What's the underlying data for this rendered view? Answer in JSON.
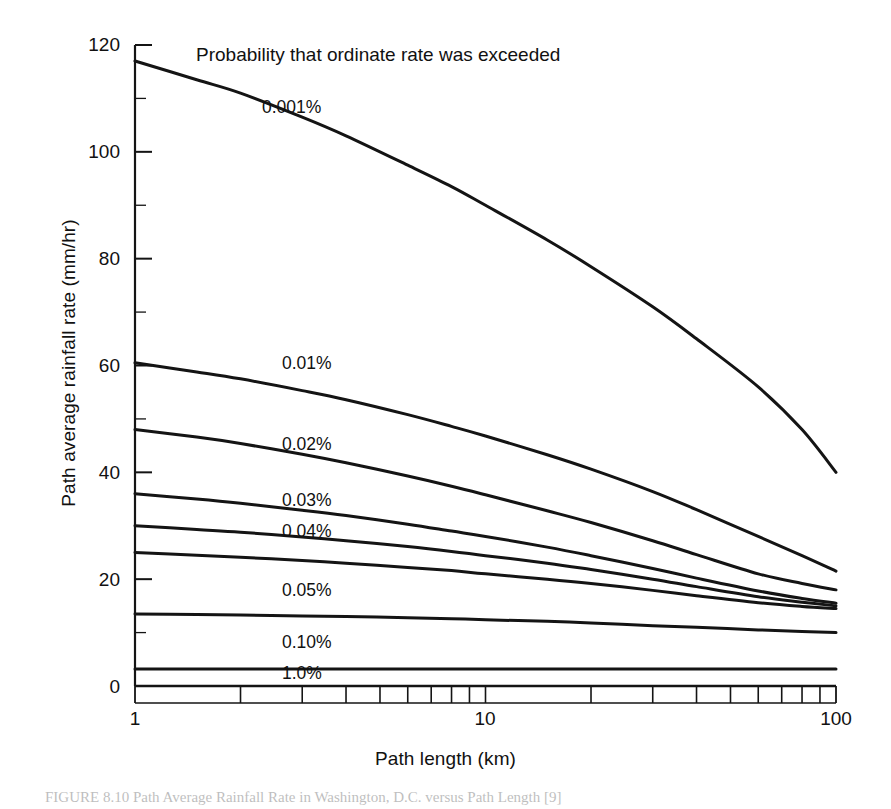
{
  "chart_data": {
    "type": "line",
    "title": "",
    "xlabel": "Path length (km)",
    "ylabel": "Path average rainfall rate (mm/hr)",
    "annotation": "Probability that ordinate rate was exceeded",
    "xscale": "log",
    "yscale": "linear",
    "xlim": [
      1,
      100
    ],
    "ylim": [
      0,
      120
    ],
    "grid": false,
    "legend_position": "inline-curve-labels",
    "xticks": [
      1,
      10,
      100
    ],
    "xtick_labels": [
      "1",
      "10",
      "100"
    ],
    "xminor_ticks": [
      2,
      3,
      4,
      5,
      6,
      7,
      8,
      9,
      20,
      30,
      40,
      50,
      60,
      70,
      80,
      90
    ],
    "yticks": [
      0,
      20,
      40,
      60,
      80,
      100,
      120
    ],
    "ytick_labels": [
      "0",
      "20",
      "40",
      "60",
      "80",
      "100",
      "120"
    ],
    "yminor_ticks": [
      10,
      30,
      50,
      70,
      90,
      110
    ],
    "units": {
      "x": "km",
      "y": "mm/hr"
    },
    "series": [
      {
        "name": "0.001%",
        "label": "0.001%",
        "x": [
          1,
          1.5,
          2,
          3,
          4,
          6,
          8,
          10,
          15,
          20,
          30,
          40,
          60,
          80,
          100
        ],
        "values": [
          117,
          113.5,
          111,
          106.5,
          103,
          97.5,
          93.5,
          90,
          83.5,
          78.5,
          71,
          65,
          56,
          48,
          40
        ]
      },
      {
        "name": "0.01%",
        "label": "0.01%",
        "x": [
          1,
          1.5,
          2,
          3,
          4,
          6,
          8,
          10,
          15,
          20,
          30,
          40,
          60,
          80,
          100
        ],
        "values": [
          60.5,
          58.8,
          57.5,
          55.3,
          53.6,
          50.8,
          48.6,
          46.8,
          43.3,
          40.6,
          36.4,
          33,
          28,
          24.4,
          21.5
        ]
      },
      {
        "name": "0.02%",
        "label": "0.02%",
        "x": [
          1,
          1.5,
          2,
          3,
          4,
          6,
          8,
          10,
          15,
          20,
          30,
          40,
          60,
          80,
          100
        ],
        "values": [
          48,
          46.6,
          45.4,
          43.4,
          41.8,
          39.3,
          37.4,
          35.8,
          32.8,
          30.6,
          27.2,
          24.6,
          21,
          19.2,
          18
        ]
      },
      {
        "name": "0.03%",
        "label": "0.03%",
        "x": [
          1,
          1.5,
          2,
          3,
          4,
          6,
          8,
          10,
          15,
          20,
          30,
          40,
          60,
          80,
          100
        ],
        "values": [
          36,
          35,
          34.2,
          32.9,
          31.9,
          30.3,
          29,
          28,
          26,
          24.4,
          22,
          20.2,
          17.8,
          16.4,
          15.5
        ]
      },
      {
        "name": "0.04%",
        "label": "0.04%",
        "x": [
          1,
          1.5,
          2,
          3,
          4,
          6,
          8,
          10,
          15,
          20,
          30,
          40,
          60,
          80,
          100
        ],
        "values": [
          30,
          29.3,
          28.8,
          27.9,
          27.2,
          26.1,
          25.2,
          24.4,
          23,
          21.8,
          20,
          18.6,
          16.7,
          15.7,
          15
        ]
      },
      {
        "name": "0.05%",
        "label": "0.05%",
        "x": [
          1,
          1.5,
          2,
          3,
          4,
          6,
          8,
          10,
          15,
          20,
          30,
          40,
          60,
          80,
          100
        ],
        "values": [
          25,
          24.5,
          24.1,
          23.5,
          23,
          22.2,
          21.6,
          21,
          20,
          19.2,
          17.9,
          16.9,
          15.6,
          14.9,
          14.5
        ]
      },
      {
        "name": "0.10%",
        "label": "0.10%",
        "x": [
          1,
          1.5,
          2,
          3,
          4,
          6,
          8,
          10,
          15,
          20,
          30,
          40,
          60,
          80,
          100
        ],
        "values": [
          13.5,
          13.4,
          13.3,
          13.1,
          13,
          12.8,
          12.6,
          12.4,
          12.1,
          11.8,
          11.3,
          11,
          10.5,
          10.2,
          10
        ]
      },
      {
        "name": "1.0%",
        "label": "1.0%",
        "x": [
          1,
          10,
          100
        ],
        "values": [
          3.2,
          3.2,
          3.2
        ]
      }
    ],
    "curve_labels": [
      {
        "text": "0.001%",
        "x_px": 262,
        "y_px": 97
      },
      {
        "text": "0.01%",
        "x_px": 282,
        "y_px": 353
      },
      {
        "text": "0.02%",
        "x_px": 282,
        "y_px": 434
      },
      {
        "text": "0.03%",
        "x_px": 282,
        "y_px": 490
      },
      {
        "text": "0.04%",
        "x_px": 282,
        "y_px": 521
      },
      {
        "text": "0.05%",
        "x_px": 282,
        "y_px": 580
      },
      {
        "text": "0.10%",
        "x_px": 282,
        "y_px": 632
      },
      {
        "text": "1.0%",
        "x_px": 282,
        "y_px": 663
      }
    ]
  },
  "figure": {
    "caption": "FIGURE 8.10    Path Average Rainfall Rate in Washington, D.C. versus Path Length [9]"
  },
  "style": {
    "line_color": "#141414",
    "axis_color": "#141414",
    "background": "#ffffff",
    "text_color": "#111111"
  }
}
